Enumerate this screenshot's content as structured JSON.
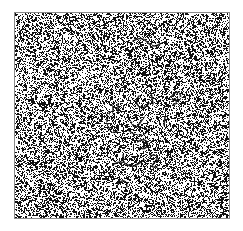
{
  "figure": {
    "kind": "random-dot-noise-stimulus",
    "title": "",
    "caption": "",
    "canvas_width": 243,
    "canvas_height": 231,
    "background_color": "#ffffff"
  },
  "panel": {
    "x": 14,
    "y": 12,
    "width": 216,
    "height": 207,
    "fill_color": "#ffffff",
    "border_color": "#8a8a8a",
    "border_width": 1
  },
  "noise": {
    "description": "dense binary salt-and-pepper speckle filling the bordered square",
    "dot_color": "#111111",
    "dot_size_px": 1,
    "coverage_fraction": 0.3,
    "seed": 20240517,
    "edge_fade_px": 2,
    "edge_fade_coverage": 0.2
  },
  "embedded_strokes": {
    "description": "faint darker hand-drawn squiggle fragments hidden inside the noise field near the center",
    "stroke_color": "#0a0a0a",
    "stroke_width": 1.6,
    "stroke_opacity": 0.85,
    "paths": [
      {
        "name": "squiggle-top-arc",
        "points": [
          [
            119,
            29
          ],
          [
            124,
            26
          ],
          [
            130,
            27
          ],
          [
            134,
            31
          ],
          [
            138,
            34
          ],
          [
            143,
            34
          ],
          [
            147,
            31
          ]
        ]
      },
      {
        "name": "squiggle-upper-right-hook",
        "points": [
          [
            157,
            85
          ],
          [
            160,
            81
          ],
          [
            164,
            80
          ],
          [
            167,
            83
          ],
          [
            166,
            88
          ],
          [
            162,
            90
          ]
        ]
      },
      {
        "name": "squiggle-c-cluster",
        "points": [
          [
            125,
            84
          ],
          [
            122,
            88
          ],
          [
            123,
            93
          ],
          [
            127,
            96
          ],
          [
            132,
            95
          ],
          [
            135,
            91
          ]
        ]
      },
      {
        "name": "squiggle-double-tick",
        "points": [
          [
            137,
            80
          ],
          [
            138,
            86
          ],
          [
            139,
            92
          ]
        ]
      },
      {
        "name": "squiggle-left-hook",
        "points": [
          [
            96,
            100
          ],
          [
            93,
            105
          ],
          [
            93,
            112
          ],
          [
            96,
            118
          ],
          [
            100,
            121
          ],
          [
            103,
            119
          ]
        ]
      },
      {
        "name": "squiggle-left-tick-a",
        "points": [
          [
            99,
            93
          ],
          [
            99,
            101
          ]
        ]
      },
      {
        "name": "squiggle-left-tick-b",
        "points": [
          [
            104,
            92
          ],
          [
            104,
            100
          ]
        ]
      },
      {
        "name": "squiggle-center-v",
        "points": [
          [
            117,
            110
          ],
          [
            121,
            117
          ],
          [
            126,
            111
          ],
          [
            130,
            105
          ]
        ]
      },
      {
        "name": "squiggle-center-arc",
        "points": [
          [
            114,
            118
          ],
          [
            119,
            122
          ],
          [
            125,
            124
          ],
          [
            131,
            122
          ],
          [
            135,
            117
          ]
        ]
      },
      {
        "name": "squiggle-mid-right-tick",
        "points": [
          [
            151,
            105
          ],
          [
            150,
            113
          ]
        ]
      },
      {
        "name": "squiggle-center-lower-loop",
        "points": [
          [
            123,
            130
          ],
          [
            128,
            127
          ],
          [
            133,
            129
          ],
          [
            134,
            134
          ],
          [
            130,
            137
          ],
          [
            126,
            136
          ]
        ]
      },
      {
        "name": "squiggle-lower-wave",
        "points": [
          [
            100,
            152
          ],
          [
            106,
            149
          ],
          [
            112,
            152
          ],
          [
            118,
            155
          ],
          [
            124,
            152
          ],
          [
            130,
            148
          ]
        ]
      },
      {
        "name": "squiggle-lower-two",
        "points": [
          [
            136,
            144
          ],
          [
            141,
            142
          ],
          [
            144,
            146
          ],
          [
            140,
            151
          ],
          [
            137,
            155
          ],
          [
            143,
            155
          ]
        ]
      },
      {
        "name": "squiggle-lower-tick",
        "points": [
          [
            109,
            143
          ],
          [
            110,
            150
          ]
        ]
      },
      {
        "name": "squiggle-bottom-mark",
        "points": [
          [
            104,
            172
          ],
          [
            108,
            168
          ],
          [
            112,
            170
          ],
          [
            113,
            175
          ]
        ]
      },
      {
        "name": "squiggle-right-blob",
        "points": [
          [
            158,
            88
          ],
          [
            162,
            86
          ],
          [
            165,
            88
          ],
          [
            163,
            92
          ],
          [
            159,
            92
          ]
        ]
      }
    ]
  }
}
